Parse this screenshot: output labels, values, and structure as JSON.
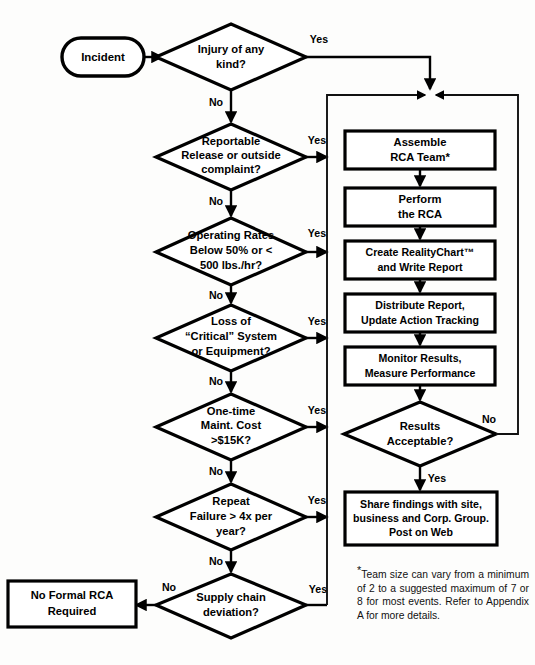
{
  "diagram": {
    "background_color": "#fdfdfc",
    "line_color": "#000000",
    "shape_fill": "#ffffff"
  },
  "start": {
    "label": "Incident"
  },
  "decisions": [
    {
      "id": "injury",
      "line1": "Injury of any",
      "line2": "kind?",
      "line3": "",
      "yes": "Yes",
      "no": "No"
    },
    {
      "id": "reportable",
      "line1": "Reportable",
      "line2": "Release or outside",
      "line3": "complaint?",
      "yes": "Yes",
      "no": "No"
    },
    {
      "id": "rates",
      "line1": "Operating Rates",
      "line2": "Below 50% or <",
      "line3": "500 lbs./hr?",
      "yes": "Yes",
      "no": "No"
    },
    {
      "id": "critical",
      "line1": "Loss of",
      "line2": "“Critical” System",
      "line3": "or Equipment?",
      "yes": "Yes",
      "no": "No"
    },
    {
      "id": "maintcost",
      "line1": "One-time",
      "line2": "Maint. Cost",
      "line3": ">$15K?",
      "yes": "Yes",
      "no": "No"
    },
    {
      "id": "repeat",
      "line1": "Repeat",
      "line2": "Failure > 4x per",
      "line3": "year?",
      "yes": "Yes",
      "no": "No"
    },
    {
      "id": "supplychain",
      "line1": "Supply chain",
      "line2": "deviation?",
      "line3": "",
      "yes": "Yes",
      "no": "No"
    }
  ],
  "process_boxes": [
    {
      "id": "assemble",
      "line1": "Assemble",
      "line2": "RCA Team*",
      "line3": ""
    },
    {
      "id": "perform",
      "line1": "Perform",
      "line2": "the RCA",
      "line3": ""
    },
    {
      "id": "realitychart",
      "line1": "Create RealityChart™",
      "line2": "and Write Report",
      "line3": ""
    },
    {
      "id": "distribute",
      "line1": "Distribute Report,",
      "line2": "Update Action Tracking",
      "line3": ""
    },
    {
      "id": "monitor",
      "line1": "Monitor Results,",
      "line2": "Measure Performance",
      "line3": ""
    },
    {
      "id": "share",
      "line1": "Share findings with site,",
      "line2": "business and Corp. Group.",
      "line3": "Post on Web"
    }
  ],
  "results_decision": {
    "line1": "Results",
    "line2": "Acceptable?",
    "yes": "Yes",
    "no": "No"
  },
  "end_box": {
    "line1": "No Formal RCA",
    "line2": "Required"
  },
  "footnote": {
    "marker": "*",
    "text": "Team size can vary from a minimum of 2 to a suggested maximum of 7 or 8 for most events. Refer to Appendix A for more details."
  }
}
